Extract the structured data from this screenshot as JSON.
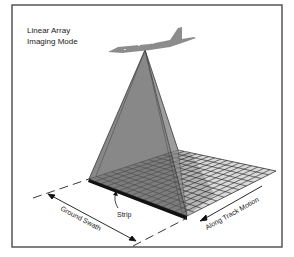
{
  "title": {
    "line1": "Linear Array",
    "line2": "Imaging Mode"
  },
  "labels": {
    "strip": "Strip",
    "ground_swath": "Ground Swath",
    "along_track_motion": "Along Track Motion"
  },
  "icons": {
    "aircraft": "aircraft-silhouette-icon"
  },
  "colors": {
    "frame": "#555555",
    "pyramid_left": "#8a8a8a",
    "pyramid_right": "#a3a3a3",
    "grid_fill": "#d8d8d8",
    "grid_shadow": "#6a6a6a",
    "strip": "#111111",
    "aircraft": "#8c8c8c",
    "text": "#222222"
  },
  "grid": {
    "rows": 12,
    "cols": 16
  }
}
